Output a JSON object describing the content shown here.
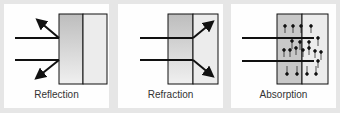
{
  "panels": [
    {
      "id": "reflection",
      "caption": "Reflection"
    },
    {
      "id": "refraction",
      "caption": "Refraction"
    },
    {
      "id": "absorption",
      "caption": "Absorption"
    }
  ],
  "colors": {
    "background": "#e6e6e6",
    "panel": "#fefefe",
    "stroke": "#111111",
    "left_half": "#c8c8c8",
    "right_half": "#ececec"
  }
}
